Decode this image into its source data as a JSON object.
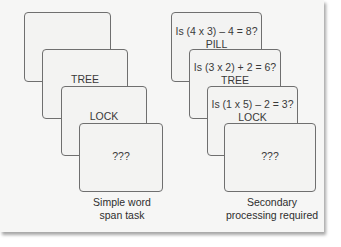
{
  "figure": {
    "left_panel": {
      "caption_line1": "Simple word",
      "caption_line2": "span task",
      "cards": [
        {
          "word": "PILL"
        },
        {
          "word": "TREE"
        },
        {
          "word": "LOCK"
        },
        {
          "word": "???"
        }
      ]
    },
    "right_panel": {
      "caption_line1": "Secondary",
      "caption_line2": "processing required",
      "cards": [
        {
          "question": "Is (4 x 3) – 4 = 8?",
          "word": "PILL"
        },
        {
          "question": "Is (3 x 2) + 2 = 6?",
          "word": "TREE"
        },
        {
          "question": "Is (1 x 5) – 2 = 3?",
          "word": "LOCK"
        },
        {
          "word": "???"
        }
      ]
    }
  }
}
